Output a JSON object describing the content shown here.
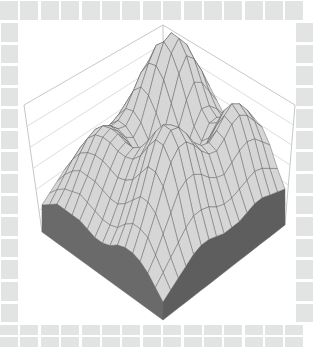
{
  "figure": {
    "type": "surface-plot-3d",
    "title": "",
    "background_color": "#ffffff",
    "border_tile_color": "#e2e4e4",
    "surface_color": "#d4d4d4",
    "mesh_line_color": "#4a4a4a",
    "base_skirt_color": "#6a6a6a",
    "wall_grid_color": "#cfcfcf"
  },
  "border": {
    "top_tile_count": 15,
    "bottom_tile_count": 30,
    "left_tile_count": 14,
    "right_tile_count": 14
  },
  "axes": {
    "back_wall_gridline_count": 5,
    "apex": {
      "x": 163,
      "y": 25
    },
    "left_corner": {
      "x": 24,
      "y": 105
    },
    "right_corner": {
      "x": 295,
      "y": 105
    },
    "front_corner": {
      "x": 163,
      "y": 320
    },
    "left_base_corner": {
      "x": 42,
      "y": 232
    },
    "right_base_corner": {
      "x": 285,
      "y": 225
    }
  },
  "chart_data": {
    "type": "surface",
    "title": "",
    "xlabel": "",
    "ylabel": "",
    "zlabel": "",
    "grid": true,
    "legend": "none",
    "nx": 17,
    "ny": 17,
    "xlim": [
      0,
      16
    ],
    "ylim": [
      0,
      16
    ],
    "zlim": [
      0,
      1
    ],
    "projection": "isometric",
    "z": [
      [
        0.22,
        0.28,
        0.36,
        0.46,
        0.54,
        0.58,
        0.56,
        0.5,
        0.44,
        0.42,
        0.46,
        0.52,
        0.56,
        0.54,
        0.46,
        0.34,
        0.24
      ],
      [
        0.26,
        0.34,
        0.46,
        0.6,
        0.7,
        0.74,
        0.7,
        0.6,
        0.52,
        0.48,
        0.52,
        0.6,
        0.66,
        0.62,
        0.52,
        0.38,
        0.26
      ],
      [
        0.32,
        0.44,
        0.6,
        0.76,
        0.86,
        0.88,
        0.82,
        0.7,
        0.58,
        0.54,
        0.58,
        0.68,
        0.74,
        0.7,
        0.58,
        0.42,
        0.28
      ],
      [
        0.38,
        0.52,
        0.7,
        0.86,
        0.96,
        0.96,
        0.88,
        0.74,
        0.6,
        0.54,
        0.58,
        0.7,
        0.78,
        0.74,
        0.6,
        0.44,
        0.3
      ],
      [
        0.4,
        0.56,
        0.74,
        0.88,
        0.94,
        0.9,
        0.8,
        0.66,
        0.52,
        0.46,
        0.52,
        0.64,
        0.74,
        0.72,
        0.58,
        0.42,
        0.3
      ],
      [
        0.4,
        0.54,
        0.7,
        0.8,
        0.82,
        0.76,
        0.64,
        0.52,
        0.42,
        0.38,
        0.44,
        0.58,
        0.68,
        0.66,
        0.54,
        0.4,
        0.28
      ],
      [
        0.38,
        0.5,
        0.62,
        0.68,
        0.66,
        0.58,
        0.48,
        0.38,
        0.32,
        0.32,
        0.4,
        0.54,
        0.64,
        0.62,
        0.5,
        0.38,
        0.26
      ],
      [
        0.36,
        0.46,
        0.54,
        0.56,
        0.52,
        0.44,
        0.36,
        0.3,
        0.28,
        0.32,
        0.42,
        0.56,
        0.66,
        0.64,
        0.52,
        0.38,
        0.26
      ],
      [
        0.34,
        0.44,
        0.5,
        0.5,
        0.46,
        0.4,
        0.34,
        0.3,
        0.32,
        0.38,
        0.5,
        0.64,
        0.72,
        0.7,
        0.56,
        0.4,
        0.26
      ],
      [
        0.34,
        0.44,
        0.5,
        0.52,
        0.5,
        0.46,
        0.42,
        0.4,
        0.44,
        0.52,
        0.64,
        0.76,
        0.82,
        0.78,
        0.62,
        0.44,
        0.28
      ],
      [
        0.34,
        0.46,
        0.54,
        0.58,
        0.58,
        0.56,
        0.54,
        0.54,
        0.58,
        0.66,
        0.78,
        0.88,
        0.9,
        0.84,
        0.66,
        0.46,
        0.3
      ],
      [
        0.34,
        0.46,
        0.56,
        0.62,
        0.64,
        0.64,
        0.62,
        0.62,
        0.66,
        0.74,
        0.84,
        0.92,
        0.92,
        0.84,
        0.66,
        0.46,
        0.3
      ],
      [
        0.32,
        0.44,
        0.54,
        0.6,
        0.62,
        0.62,
        0.6,
        0.6,
        0.62,
        0.68,
        0.78,
        0.86,
        0.86,
        0.78,
        0.62,
        0.42,
        0.28
      ],
      [
        0.3,
        0.4,
        0.48,
        0.52,
        0.54,
        0.54,
        0.52,
        0.5,
        0.52,
        0.56,
        0.64,
        0.72,
        0.72,
        0.66,
        0.52,
        0.36,
        0.24
      ],
      [
        0.26,
        0.34,
        0.4,
        0.44,
        0.44,
        0.44,
        0.42,
        0.4,
        0.4,
        0.44,
        0.5,
        0.56,
        0.56,
        0.52,
        0.42,
        0.3,
        0.2
      ],
      [
        0.22,
        0.28,
        0.32,
        0.34,
        0.36,
        0.34,
        0.32,
        0.3,
        0.3,
        0.32,
        0.38,
        0.42,
        0.42,
        0.4,
        0.32,
        0.24,
        0.16
      ],
      [
        0.18,
        0.22,
        0.26,
        0.26,
        0.26,
        0.26,
        0.24,
        0.22,
        0.22,
        0.24,
        0.28,
        0.3,
        0.3,
        0.28,
        0.24,
        0.18,
        0.12
      ]
    ]
  }
}
